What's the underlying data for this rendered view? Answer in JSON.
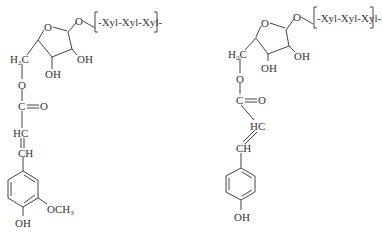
{
  "diagram": {
    "type": "chemical-structures",
    "color": "#333333",
    "structures": [
      {
        "name": "feruloyl-arabinofuranosyl-xylotriose",
        "labels": {
          "ring_o": "O",
          "link_o": "O",
          "chain": "-Xyl-Xyl-Xyl-",
          "h2c": "H2C",
          "oh_c2": "OH",
          "oh_c3": "OH",
          "ester_o": "O",
          "carbonyl_c": "C",
          "carbonyl_o": "O",
          "hc": "HC",
          "ch": "CH",
          "methoxy": "OCH3",
          "phenol_oh": "OH"
        }
      },
      {
        "name": "p-coumaroyl-arabinofuranosyl-xylotriose",
        "labels": {
          "ring_o": "O",
          "link_o": "O",
          "chain": "-Xyl-Xyl-Xyl-",
          "h2c": "H2C",
          "oh_c2": "OH",
          "oh_c3": "OH",
          "ester_o": "O",
          "carbonyl_c": "C",
          "carbonyl_o": "O",
          "hc": "HC",
          "ch": "CH",
          "phenol_oh": "OH"
        }
      }
    ]
  }
}
